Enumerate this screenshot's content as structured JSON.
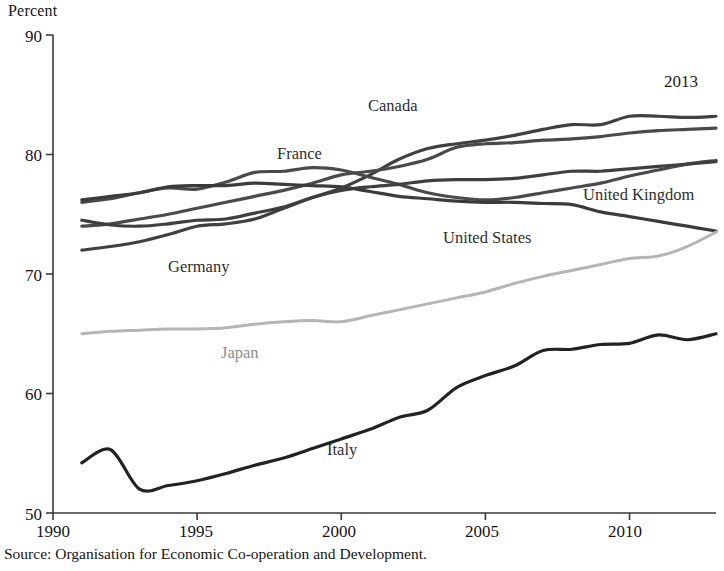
{
  "figure": {
    "y_axis_unit_label": "Percent",
    "end_year_annotation": "2013",
    "source_note": "Source: Organisation for Economic Co-operation and Development."
  },
  "axes": {
    "y_ticks": [
      "50",
      "60",
      "70",
      "80",
      "90"
    ],
    "x_ticks": [
      "1990",
      "1995",
      "2000",
      "2005",
      "2010"
    ]
  },
  "series_labels": {
    "canada": "Canada",
    "france": "France",
    "germany": "Germany",
    "united_kingdom": "United Kingdom",
    "united_states": "United States",
    "japan": "Japan",
    "italy": "Italy"
  },
  "colors": {
    "canada": "#404040",
    "france": "#4a4a4a",
    "germany": "#4a4a4a",
    "united_kingdom": "#3f3f3f",
    "united_states": "#3b3b3b",
    "japan": "#b5b5b5",
    "italy": "#222222",
    "axis": "#3a3a3a",
    "background": "#ffffff"
  },
  "chart_data": {
    "type": "line",
    "title": "",
    "subtitle": "",
    "xlabel": "",
    "ylabel": "Percent",
    "xlim": [
      1990,
      2013
    ],
    "ylim": [
      50,
      90
    ],
    "grid": false,
    "legend": "inline-labels",
    "x": [
      1991,
      1992,
      1993,
      1994,
      1995,
      1996,
      1997,
      1998,
      1999,
      2000,
      2001,
      2002,
      2003,
      2004,
      2005,
      2006,
      2007,
      2008,
      2009,
      2010,
      2011,
      2012,
      2013
    ],
    "series": [
      {
        "name": "Canada",
        "color": "#404040",
        "values": [
          72.0,
          72.3,
          72.7,
          73.3,
          74.0,
          74.2,
          74.6,
          75.5,
          76.4,
          77.2,
          78.3,
          79.6,
          80.5,
          80.9,
          81.2,
          81.6,
          82.1,
          82.5,
          82.5,
          83.2,
          83.2,
          83.1,
          83.2
        ]
      },
      {
        "name": "France",
        "color": "#4a4a4a",
        "values": [
          74.0,
          74.2,
          74.6,
          75.0,
          75.5,
          76.0,
          76.5,
          77.0,
          77.6,
          78.3,
          78.6,
          79.0,
          79.6,
          80.6,
          80.9,
          81.0,
          81.2,
          81.3,
          81.5,
          81.8,
          82.0,
          82.1,
          82.2
        ]
      },
      {
        "name": "Germany",
        "color": "#4a4a4a",
        "values": [
          76.0,
          76.3,
          76.8,
          77.2,
          77.1,
          77.7,
          78.5,
          78.6,
          78.9,
          78.7,
          78.1,
          77.5,
          76.8,
          76.4,
          76.2,
          76.4,
          76.8,
          77.2,
          77.6,
          78.2,
          78.7,
          79.2,
          79.5
        ]
      },
      {
        "name": "United Kingdom",
        "color": "#3f3f3f",
        "values": [
          74.5,
          74.1,
          74.0,
          74.2,
          74.5,
          74.6,
          75.1,
          75.6,
          76.4,
          77.0,
          77.3,
          77.5,
          77.8,
          77.9,
          77.9,
          78.0,
          78.3,
          78.6,
          78.6,
          78.8,
          79.0,
          79.2,
          79.4
        ]
      },
      {
        "name": "United States",
        "color": "#3b3b3b",
        "values": [
          76.2,
          76.5,
          76.8,
          77.3,
          77.4,
          77.4,
          77.6,
          77.5,
          77.4,
          77.3,
          76.9,
          76.5,
          76.3,
          76.1,
          76.0,
          76.0,
          75.9,
          75.8,
          75.2,
          74.8,
          74.4,
          74.0,
          73.6
        ]
      },
      {
        "name": "Japan",
        "color": "#b5b5b5",
        "values": [
          65.0,
          65.2,
          65.3,
          65.4,
          65.4,
          65.5,
          65.8,
          66.0,
          66.1,
          66.0,
          66.5,
          67.0,
          67.5,
          68.0,
          68.5,
          69.2,
          69.8,
          70.3,
          70.8,
          71.3,
          71.5,
          72.3,
          73.5
        ]
      },
      {
        "name": "Italy",
        "color": "#222222",
        "values": [
          54.2,
          55.3,
          52.0,
          52.3,
          52.7,
          53.3,
          54.0,
          54.6,
          55.4,
          56.2,
          57.0,
          58.0,
          58.6,
          60.5,
          61.5,
          62.3,
          63.6,
          63.7,
          64.1,
          64.2,
          64.9,
          64.5,
          65.0
        ]
      }
    ]
  }
}
